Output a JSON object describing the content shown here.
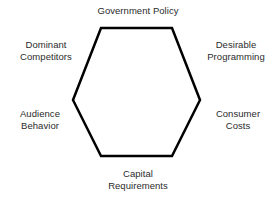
{
  "diagram": {
    "type": "hexagon-force-diagram",
    "background_color": "#ffffff",
    "shape": {
      "name": "hexagon",
      "stroke_color": "#000000",
      "stroke_width": 2.5,
      "fill": "none",
      "points": "101,28 172,28 200,100 172,156 101,156 73,100"
    },
    "labels": {
      "top": "Government Policy",
      "upper_left": "Dominant\nCompetitors",
      "upper_left_line1": "Dominant",
      "upper_left_line2": "Competitors",
      "upper_right": "Desirable\nProgramming",
      "upper_right_line1": "Desirable",
      "upper_right_line2": "Programming",
      "lower_left": "Audience\nBehavior",
      "lower_left_line1": "Audience",
      "lower_left_line2": "Behavior",
      "lower_right": "Consumer\nCosts",
      "lower_right_line1": "Consumer",
      "lower_right_line2": "Costs",
      "bottom": "Capital\nRequirements",
      "bottom_line1": "Capital",
      "bottom_line2": "Requirements"
    },
    "text_color": "#2b2b2b"
  }
}
